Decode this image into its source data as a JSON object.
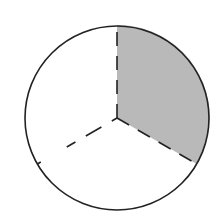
{
  "diagram": {
    "title": "Circle divided into three equal parts with one part shaded",
    "parts_total": 3,
    "parts_shaded": 1,
    "fraction_shaded": "1/3",
    "colors": {
      "shade": "#b9b9b9",
      "stroke": "#222222",
      "background": "#ffffff"
    }
  }
}
